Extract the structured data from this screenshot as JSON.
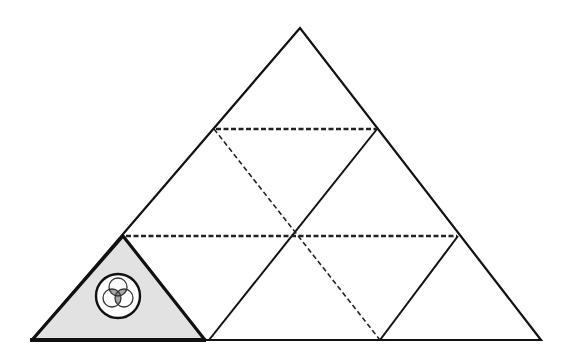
{
  "diagram": {
    "type": "triangle-net",
    "colors": {
      "stroke": "#111111",
      "shade_fill": "#e2e2e2",
      "overlap_fill": "#8a8a8a",
      "background": "#ffffff"
    },
    "outer_triangle": {
      "apex": [
        300,
        28
      ],
      "bottom_left": [
        32,
        340
      ],
      "bottom_right": [
        541,
        340
      ]
    },
    "dashed_lines": [
      {
        "name": "upper-horizontal",
        "from": [
          214,
          129
        ],
        "to": [
          377,
          129
        ]
      },
      {
        "name": "lower-horizontal",
        "from": [
          123,
          236
        ],
        "to": [
          458,
          236
        ]
      },
      {
        "name": "diagonal",
        "from": [
          214,
          129
        ],
        "to": [
          380,
          340
        ]
      }
    ],
    "solid_lines": [
      {
        "name": "inner-left-diagonal",
        "from": [
          377,
          129
        ],
        "to": [
          209,
          340
        ]
      },
      {
        "name": "inner-right-diagonal",
        "from": [
          458,
          236
        ],
        "to": [
          380,
          340
        ]
      }
    ],
    "shaded_triangle": {
      "points": [
        [
          32,
          340
        ],
        [
          123,
          236
        ],
        [
          205,
          340
        ]
      ]
    },
    "emblem": {
      "outer_circle": {
        "cx": 118,
        "cy": 296,
        "r": 22
      },
      "inner_circles": [
        {
          "cx": 118,
          "cy": 287,
          "r": 9
        },
        {
          "cx": 112,
          "cy": 298,
          "r": 9
        },
        {
          "cx": 124,
          "cy": 298,
          "r": 9
        }
      ]
    }
  }
}
